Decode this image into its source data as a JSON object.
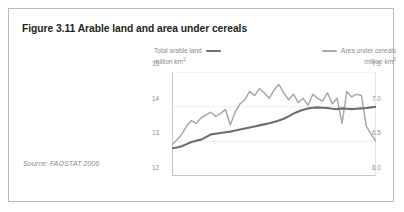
{
  "figure": {
    "title": "Figure 3.11 Arable land and area under cereals",
    "source": "Source: FAOSTAT 2006"
  },
  "legend": {
    "left": {
      "name": "Total arable land",
      "unit": "million km2",
      "color": "#6d6e71"
    },
    "right": {
      "name": "Area under cereals",
      "unit": "million km2",
      "color": "#a7a9ac"
    }
  },
  "axes": {
    "left_ticks": [
      "15",
      "14",
      "13",
      "12"
    ],
    "right_ticks": [
      "7.5",
      "7.0",
      "6.5",
      "6.0"
    ],
    "x_ticks": [
      "1960",
      "1964",
      "1968",
      "1972",
      "1976",
      "1980",
      "1984",
      "1988",
      "1992",
      "1996",
      "2000",
      "2002"
    ]
  },
  "chart_data": {
    "type": "line",
    "title": "Figure 3.11 Arable land and area under cereals",
    "xlabel": "",
    "grid": true,
    "legend_position": "top",
    "x": [
      1960,
      1961,
      1962,
      1963,
      1964,
      1965,
      1966,
      1967,
      1968,
      1969,
      1970,
      1971,
      1972,
      1973,
      1974,
      1975,
      1976,
      1977,
      1978,
      1979,
      1980,
      1981,
      1982,
      1983,
      1984,
      1985,
      1986,
      1987,
      1988,
      1989,
      1990,
      1991,
      1992,
      1993,
      1994,
      1995,
      1996,
      1997,
      1998,
      1999,
      2000,
      2001,
      2002
    ],
    "x_tick_labels": [
      "1960",
      "1964",
      "1968",
      "1972",
      "1976",
      "1980",
      "1984",
      "1988",
      "1992",
      "1996",
      "2000",
      "2002"
    ],
    "series": [
      {
        "name": "Total arable land",
        "unit": "million km2",
        "axis": "left",
        "color": "#6d6e71",
        "ylabel": "million km2",
        "ylim": [
          12,
          15
        ],
        "yticks": [
          12,
          13,
          14,
          15
        ],
        "values": [
          12.8,
          12.82,
          12.86,
          12.92,
          12.98,
          13.02,
          13.05,
          13.12,
          13.2,
          13.22,
          13.24,
          13.26,
          13.28,
          13.31,
          13.34,
          13.37,
          13.4,
          13.43,
          13.46,
          13.49,
          13.52,
          13.56,
          13.6,
          13.65,
          13.72,
          13.8,
          13.86,
          13.91,
          13.95,
          13.97,
          13.98,
          13.97,
          13.96,
          13.94,
          13.93,
          13.95,
          13.94,
          13.93,
          13.94,
          13.95,
          13.96,
          13.98,
          14.0
        ]
      },
      {
        "name": "Area under cereals",
        "unit": "million km2",
        "axis": "right",
        "color": "#a7a9ac",
        "ylabel": "million km2",
        "ylim": [
          6.0,
          7.5
        ],
        "yticks": [
          6.0,
          6.5,
          7.0,
          7.5
        ],
        "values": [
          6.45,
          6.52,
          6.6,
          6.72,
          6.8,
          6.76,
          6.84,
          6.88,
          6.92,
          6.86,
          6.9,
          6.96,
          6.74,
          6.92,
          7.04,
          7.1,
          7.22,
          7.16,
          7.26,
          7.2,
          7.12,
          7.24,
          7.32,
          7.2,
          7.1,
          7.18,
          7.06,
          7.12,
          7.02,
          7.18,
          7.12,
          7.08,
          7.2,
          7.04,
          7.12,
          6.76,
          7.22,
          7.14,
          7.18,
          7.16,
          6.72,
          6.6,
          6.5
        ]
      }
    ]
  }
}
